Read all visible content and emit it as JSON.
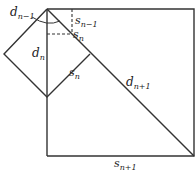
{
  "diagram": {
    "type": "geometry",
    "stroke_color": "#333333",
    "labels": {
      "d_nm1": {
        "base": "d",
        "sub": "n−1"
      },
      "s_nm1": {
        "base": "s",
        "sub": "n−1"
      },
      "s_n_top": {
        "base": "s",
        "sub": "n"
      },
      "d_n": {
        "base": "d",
        "sub": "n"
      },
      "s_n_edge": {
        "base": "s",
        "sub": "n"
      },
      "d_np1": {
        "base": "d",
        "sub": "n+1"
      },
      "s_np1": {
        "base": "s",
        "sub": "n+1"
      }
    }
  }
}
